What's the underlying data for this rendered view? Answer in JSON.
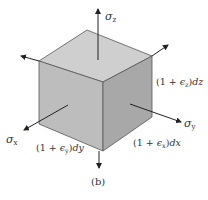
{
  "figure": {
    "caption": "(b)",
    "colors": {
      "top_face": "#cfcfcf",
      "left_face": "#bdbdbd",
      "right_face": "#a8a8a8",
      "edge": "#555555",
      "arrow": "#222222",
      "text": "#333333"
    },
    "stresses": {
      "z": {
        "symbol": "σ",
        "subscript": "z"
      },
      "x": {
        "symbol": "σ",
        "subscript": "x"
      },
      "y": {
        "symbol": "σ",
        "subscript": "y"
      }
    },
    "dimensions": {
      "dz": {
        "prefix": "(1 + ",
        "epsilon": "ϵ",
        "subscript": "z",
        "suffix": ")",
        "diff": "dz"
      },
      "dy": {
        "prefix": "(1 + ",
        "epsilon": "ϵ",
        "subscript": "y",
        "suffix": ")",
        "diff": "dy"
      },
      "dx": {
        "prefix": "(1 + ",
        "epsilon": "ϵ",
        "subscript": "x",
        "suffix": ")",
        "diff": "dx"
      }
    }
  }
}
